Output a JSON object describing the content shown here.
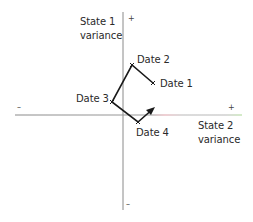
{
  "diagram": {
    "axes": {
      "vertical": {
        "label_line1": "State 1",
        "label_line2": "variance",
        "plus": "+",
        "minus": "–"
      },
      "horizontal": {
        "label_line1": "State 2",
        "label_line2": "variance",
        "plus": "+",
        "minus": "–"
      }
    },
    "points": [
      {
        "label": "Date 1",
        "x": 153,
        "y": 83
      },
      {
        "label": "Date 2",
        "x": 132,
        "y": 65
      },
      {
        "label": "Date 3",
        "x": 112,
        "y": 102
      },
      {
        "label": "Date 4",
        "x": 138,
        "y": 122
      }
    ],
    "arrow_tip": {
      "x": 154,
      "y": 108
    },
    "colors": {
      "axis": "#8a8a8a",
      "path": "#1a1a1a",
      "axis_tint_red": "#e8a0a8",
      "axis_tint_green": "#a8d890"
    }
  }
}
